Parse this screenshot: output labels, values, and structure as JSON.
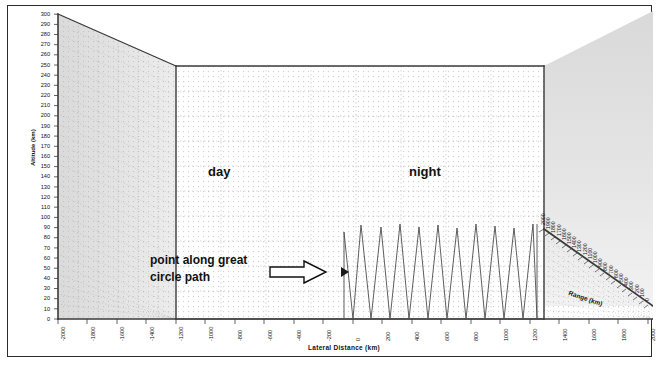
{
  "figure": {
    "type": "3d-surface-plot",
    "background_color": "#ffffff",
    "frame_color": "#2b2b2b"
  },
  "labels": {
    "day": "day",
    "night": "night",
    "annotation_line1": "point along great",
    "annotation_line2": "circle path",
    "arrow_icon": "right-block-arrow-icon"
  },
  "axes": {
    "x_title": "Lateral Distance (km)",
    "y_title": "Altitude (km)",
    "z_title": "Range (km)"
  },
  "chart_data": {
    "type": "line",
    "title": "",
    "xlabel": "Lateral Distance (km)",
    "ylabel": "Altitude (km)",
    "zlabel": "Range (km)",
    "grid": true,
    "legend": "none",
    "ylim": [
      0,
      300
    ],
    "y_ticks": [
      0,
      10,
      20,
      30,
      40,
      50,
      60,
      70,
      80,
      90,
      100,
      110,
      120,
      130,
      140,
      150,
      160,
      170,
      180,
      190,
      200,
      210,
      220,
      230,
      240,
      250,
      260,
      270,
      280,
      290,
      300
    ],
    "xlim": [
      -2000,
      2000
    ],
    "x_ticks": [
      -2000,
      -1800,
      -1600,
      -1400,
      -1200,
      -1000,
      -800,
      -600,
      -400,
      -200,
      0,
      200,
      400,
      600,
      800,
      1000,
      1200,
      1400,
      1600,
      1800,
      2000
    ],
    "x_tick_labels": [
      "-2000",
      "-1800",
      "-1600",
      "-1400",
      "-1200",
      "-1000",
      "-800",
      "-600",
      "-400",
      "-200",
      "0",
      "200",
      "400",
      "600",
      "800",
      "1000",
      "1200",
      "1400",
      "1600",
      "1800",
      "2000"
    ],
    "zlim": [
      0,
      2000
    ],
    "z_ticks": [
      0,
      100,
      200,
      300,
      400,
      500,
      600,
      700,
      800,
      900,
      1000,
      1100,
      1200,
      1300,
      1400,
      1500,
      1600,
      1700,
      1800,
      1900,
      2000
    ],
    "z_tick_labels": [
      "2000",
      "1900",
      "1800",
      "1700",
      "1600",
      "1500",
      "1400",
      "1300",
      "1200",
      "1100",
      "1000",
      "900",
      "800",
      "700",
      "600",
      "500",
      "400",
      "300",
      "200",
      "100",
      "0"
    ],
    "series": [
      {
        "name": "point along great circle path",
        "description": "sawtooth altitude oscillation between 0 and ~100 km over the night-side lateral range",
        "x": [
          0,
          0,
          40,
          95,
          150,
          205,
          260,
          315,
          370,
          425,
          480,
          535,
          590,
          645,
          700,
          755,
          810,
          865,
          920,
          975,
          1030,
          1085,
          1140,
          1195,
          1250,
          1305,
          1360,
          1415,
          1470,
          1470
        ],
        "y": [
          0,
          88,
          0,
          97,
          0,
          96,
          0,
          98,
          0,
          96,
          0,
          97,
          0,
          95,
          0,
          98,
          0,
          96,
          0,
          97,
          0,
          95,
          0,
          97,
          0,
          96,
          0,
          98,
          0,
          100
        ],
        "peak_values": [
          88,
          97,
          96,
          98,
          96,
          97,
          95,
          98,
          96,
          97,
          95,
          97,
          96,
          98,
          100
        ],
        "trough_value": 0,
        "color": "#4a4a4a"
      }
    ],
    "regions": [
      {
        "label": "day",
        "x_start": -2000,
        "x_end": 0
      },
      {
        "label": "night",
        "x_start": 0,
        "x_end": 1470
      }
    ]
  }
}
